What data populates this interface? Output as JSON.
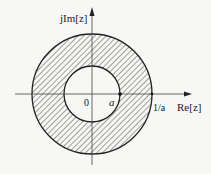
{
  "diagram": {
    "axes": {
      "x_label": "Re[z]",
      "y_label": "jIm[z]"
    },
    "labels": {
      "origin": "0",
      "inner_radius": "a",
      "outer_radius": "1/a"
    },
    "geometry": {
      "center": [
        92,
        94
      ],
      "inner_radius_px": 28,
      "outer_radius_px": 60
    },
    "colors": {
      "stroke": "#222222",
      "hatch": "#333333",
      "background": "#f7f7f5"
    }
  }
}
